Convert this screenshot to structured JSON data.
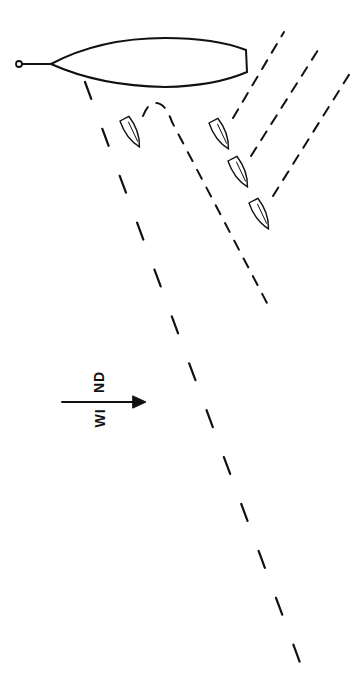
{
  "diagram": {
    "type": "sailing-start-diagram",
    "wind": {
      "label_part_1": "WI",
      "label_part_2": "ND",
      "direction": "left-to-right",
      "arrow-icon": "right-arrow"
    },
    "elements": {
      "committee_boat": {
        "shape": "hull",
        "anchor": "mark-buoy"
      },
      "boats": [
        {
          "id": "boat-1",
          "course": "tack-then-reach"
        },
        {
          "id": "boat-2",
          "course": "upwind-dashed"
        },
        {
          "id": "boat-3",
          "course": "upwind-dashed"
        },
        {
          "id": "boat-4",
          "course": "upwind-dashed"
        }
      ],
      "long_course_line": {
        "style": "long-dash"
      }
    },
    "colors": {
      "stroke": "#111111",
      "background": "#ffffff"
    }
  }
}
